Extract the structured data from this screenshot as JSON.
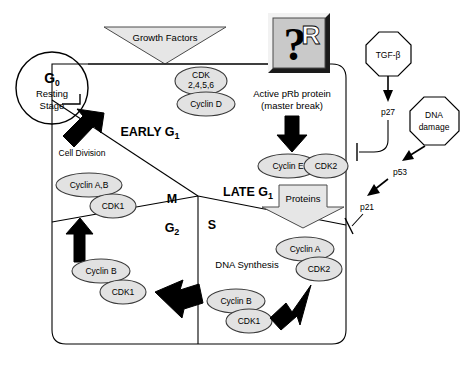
{
  "diagram": {
    "type": "cell-cycle-control-diagram"
  },
  "nodes": {
    "g0_label": "G",
    "g0_sub": "0",
    "g0_line1": "Resting",
    "g0_line2": "Stage",
    "growth_factors": "Growth Factors",
    "cdk_group_line1": "CDK",
    "cdk_group_line2": "2,4,5,6",
    "cyclin_d": "Cyclin D",
    "prb_symbol_q": "?",
    "prb_symbol_r": "R",
    "prb_caption_line1": "Active pRb protein",
    "prb_caption_line2": "(master break)",
    "cyclin_e": "Cyclin E",
    "cdk2_early": "CDK2",
    "proteins": "Proteins",
    "early_g1": "EARLY G",
    "early_g1_sub": "1",
    "late_g1": "LATE G",
    "late_g1_sub": "1",
    "cell_division": "Cell Division",
    "phase_m": "M",
    "phase_g2": "G",
    "phase_g2_sub": "2",
    "phase_s": "S",
    "dna_synthesis": "DNA Synthesis",
    "cyclin_ab": "Cyclin A,B",
    "cdk1_top": "CDK1",
    "cyclin_b_left": "Cyclin B",
    "cdk1_left": "CDK1",
    "cyclin_a_right": "Cyclin A",
    "cdk2_right": "CDK2",
    "cyclin_b_right": "Cyclin B",
    "cdk1_right": "CDK1",
    "tgf_beta": "TGF-β",
    "p27": "p27",
    "dna_damage_line1": "DNA",
    "dna_damage_line2": "damage",
    "p53": "p53",
    "p21": "p21"
  },
  "colors": {
    "ellipse_fill": "#e2e2e2",
    "banner_fill": "#e6e6e6",
    "stroke": "#000000",
    "prb_box_fill": "#c9c9c9",
    "background": "#ffffff"
  }
}
